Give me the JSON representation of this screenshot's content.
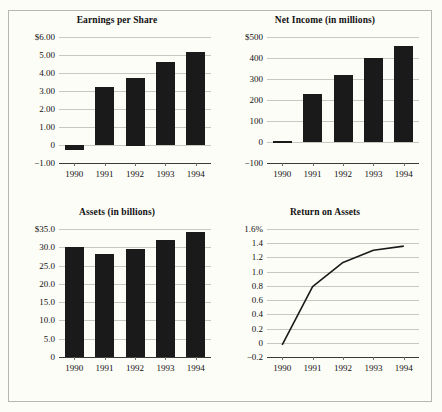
{
  "page": {
    "background_color": "#fdfdf8",
    "border_color": "#b9b6ad",
    "bar_color": "#1a1a1a",
    "grid_color": "#c9c7c0",
    "axis_color": "#3a3a3a",
    "line_color": "#1a1a1a"
  },
  "chart_data": [
    {
      "type": "bar",
      "title": "Earnings per Share",
      "xlabel": "",
      "ylabel": "",
      "categories": [
        "1990",
        "1991",
        "1992",
        "1993",
        "1994"
      ],
      "values": [
        -0.3,
        3.2,
        3.75,
        4.6,
        5.15
      ],
      "ylim": [
        -1.0,
        6.0
      ],
      "yticks": [
        6.0,
        5.0,
        4.0,
        3.0,
        2.0,
        1.0,
        0,
        -1.0
      ],
      "ytick_labels": [
        "$6.00",
        "5.00",
        "4.00",
        "3.00",
        "2.00",
        "1.00",
        "0",
        "−1.00"
      ],
      "grid": true,
      "legend": "none"
    },
    {
      "type": "bar",
      "title": "Net Income (in millions)",
      "xlabel": "",
      "ylabel": "",
      "categories": [
        "1990",
        "1991",
        "1992",
        "1993",
        "1994"
      ],
      "values": [
        3,
        227,
        317,
        402,
        457
      ],
      "ylim": [
        -100,
        500
      ],
      "yticks": [
        500,
        400,
        300,
        200,
        100,
        0,
        -100
      ],
      "ytick_labels": [
        "$500",
        "400",
        "300",
        "200",
        "100",
        "0",
        "−100"
      ],
      "grid": true,
      "legend": "none"
    },
    {
      "type": "bar",
      "title": "Assets (in billions)",
      "xlabel": "",
      "ylabel": "",
      "categories": [
        "1990",
        "1991",
        "1992",
        "1993",
        "1994"
      ],
      "values": [
        30.0,
        28.1,
        29.4,
        32.0,
        34.2
      ],
      "ylim": [
        0,
        35.0
      ],
      "yticks": [
        35.0,
        30.0,
        25.0,
        20.0,
        15.0,
        10.0,
        5.0,
        0
      ],
      "ytick_labels": [
        "$35.0",
        "30.0",
        "25.0",
        "20.0",
        "15.0",
        "10.0",
        "5.0",
        "0"
      ],
      "grid": true,
      "legend": "none"
    },
    {
      "type": "line",
      "title": "Return on Assets",
      "xlabel": "",
      "ylabel": "",
      "categories": [
        "1990",
        "1991",
        "1992",
        "1993",
        "1994"
      ],
      "values": [
        -0.03,
        0.79,
        1.13,
        1.3,
        1.36
      ],
      "ylim": [
        -0.2,
        1.6
      ],
      "yticks": [
        1.6,
        1.4,
        1.2,
        1.0,
        0.8,
        0.6,
        0.4,
        0.2,
        0,
        -0.2
      ],
      "ytick_labels": [
        "1.6%",
        "1.4",
        "1.2",
        "1.0",
        "0.8",
        "0.6",
        "0.4",
        "0.2",
        "0",
        "−0.2"
      ],
      "grid": true,
      "legend": "none"
    }
  ]
}
